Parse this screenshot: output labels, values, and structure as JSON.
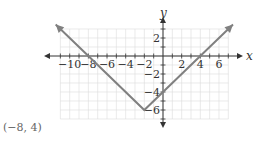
{
  "chart_data": {
    "type": "line",
    "title": "",
    "xlabel": "x",
    "ylabel": "y",
    "xlim": [
      -11,
      7
    ],
    "ylim": [
      -7,
      3
    ],
    "grid": true,
    "x_ticks": [
      -10,
      -8,
      -6,
      -4,
      -2,
      2,
      4,
      6
    ],
    "y_ticks": [
      2,
      -2,
      -4,
      -6
    ],
    "x_tick_labels": [
      "−10",
      "−8",
      "−6",
      "−4",
      "−2",
      "2",
      "4",
      "6"
    ],
    "y_tick_labels": [
      "2",
      "−2",
      "−4",
      "−6"
    ],
    "series": [
      {
        "name": "absolute value function",
        "points": [
          [
            -11.5,
            3.5
          ],
          [
            -8,
            0
          ],
          [
            -2,
            -6
          ],
          [
            4,
            0
          ],
          [
            7.5,
            3.5
          ]
        ],
        "vertex": [
          -2,
          -6
        ],
        "x_intercepts": [
          -8,
          4
        ],
        "y_intercept": -4,
        "color": "#808080"
      }
    ],
    "annotations": [
      "(−8, 4)"
    ]
  },
  "labels": {
    "x_axis": "x",
    "y_axis": "y",
    "point": "(−8, 4)"
  }
}
